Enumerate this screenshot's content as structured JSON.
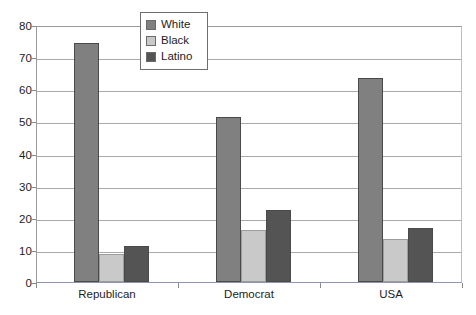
{
  "chart_data": {
    "type": "bar",
    "title": "",
    "subtitle": "",
    "xlabel": "",
    "ylabel": "",
    "categories": [
      "Republican",
      "Democrat",
      "USA"
    ],
    "series": [
      {
        "name": "White",
        "color": "#808080",
        "values": [
          74.5,
          51.3,
          63.5
        ]
      },
      {
        "name": "Black",
        "color": "#c9c9c9",
        "values": [
          8.7,
          16.2,
          13.3
        ]
      },
      {
        "name": "Latino",
        "color": "#545454",
        "values": [
          11.3,
          22.5,
          16.8
        ]
      }
    ],
    "ylim": [
      0,
      80
    ],
    "yticks": [
      0,
      10,
      20,
      30,
      40,
      50,
      60,
      70,
      80
    ],
    "ytick_labels": [
      "0",
      "10",
      "20",
      "30",
      "40",
      "50",
      "60",
      "70",
      "80"
    ],
    "grid": true,
    "grid_axis": "y",
    "legend": {
      "position": "top-center-left",
      "bordered": true
    },
    "colors": {
      "gridline": "#a9a9a9",
      "plot_border": "#9a9a9a",
      "baseline": "#8f93b4",
      "text": "#1d1d1d",
      "background": "#ffffff"
    }
  }
}
